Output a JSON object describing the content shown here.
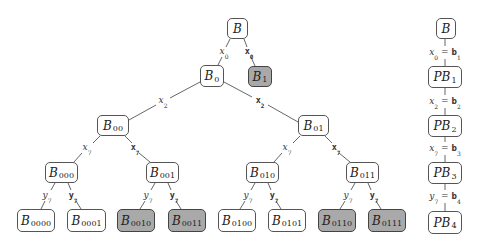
{
  "tree": {
    "nodes": [
      {
        "id": "B",
        "base": "B",
        "sub": "",
        "x": 227,
        "y": 18,
        "w": 21,
        "h": 21,
        "shaded": false
      },
      {
        "id": "B0",
        "base": "B",
        "sub": "0",
        "x": 200,
        "y": 65,
        "w": 24,
        "h": 22,
        "shaded": false
      },
      {
        "id": "B1",
        "base": "B",
        "sub": "1",
        "x": 248,
        "y": 66,
        "w": 24,
        "h": 21,
        "shaded": true
      },
      {
        "id": "B00",
        "base": "B",
        "sub": "00",
        "x": 97,
        "y": 115,
        "w": 32,
        "h": 21,
        "shaded": false
      },
      {
        "id": "B01",
        "base": "B",
        "sub": "01",
        "x": 298,
        "y": 115,
        "w": 31,
        "h": 21,
        "shaded": false
      },
      {
        "id": "B000",
        "base": "B",
        "sub": "000",
        "x": 45,
        "y": 162,
        "w": 33,
        "h": 21,
        "shaded": false
      },
      {
        "id": "B001",
        "base": "B",
        "sub": "001",
        "x": 146,
        "y": 162,
        "w": 33,
        "h": 21,
        "shaded": false
      },
      {
        "id": "B010",
        "base": "B",
        "sub": "010",
        "x": 246,
        "y": 162,
        "w": 33,
        "h": 21,
        "shaded": false
      },
      {
        "id": "B011",
        "base": "B",
        "sub": "011",
        "x": 346,
        "y": 162,
        "w": 33,
        "h": 21,
        "shaded": false
      },
      {
        "id": "B0000",
        "base": "B",
        "sub": "0000",
        "x": 17,
        "y": 209,
        "w": 38,
        "h": 23,
        "shaded": false
      },
      {
        "id": "B0001",
        "base": "B",
        "sub": "0001",
        "x": 67,
        "y": 209,
        "w": 39,
        "h": 23,
        "shaded": false
      },
      {
        "id": "B0010",
        "base": "B",
        "sub": "0010",
        "x": 117,
        "y": 209,
        "w": 38,
        "h": 23,
        "shaded": true
      },
      {
        "id": "B0011",
        "base": "B",
        "sub": "0011",
        "x": 168,
        "y": 209,
        "w": 38,
        "h": 23,
        "shaded": true
      },
      {
        "id": "B0100",
        "base": "B",
        "sub": "0100",
        "x": 218,
        "y": 209,
        "w": 38,
        "h": 23,
        "shaded": false
      },
      {
        "id": "B0101",
        "base": "B",
        "sub": "0101",
        "x": 268,
        "y": 209,
        "w": 38,
        "h": 23,
        "shaded": false
      },
      {
        "id": "B0110",
        "base": "B",
        "sub": "0110",
        "x": 318,
        "y": 209,
        "w": 38,
        "h": 23,
        "shaded": true
      },
      {
        "id": "B0111",
        "base": "B",
        "sub": "0111",
        "x": 368,
        "y": 209,
        "w": 38,
        "h": 23,
        "shaded": true
      }
    ],
    "edge_labels": [
      {
        "text": "x",
        "sub": "0",
        "style": "it",
        "x": 224,
        "y": 52
      },
      {
        "text": "x",
        "sub": "0",
        "style": "bd",
        "x": 249,
        "y": 52
      },
      {
        "text": "x",
        "sub": "2",
        "style": "it",
        "x": 163,
        "y": 101
      },
      {
        "text": "x",
        "sub": "2",
        "style": "bd",
        "x": 260,
        "y": 101
      },
      {
        "text": "x",
        "sub": "7",
        "style": "it",
        "x": 87,
        "y": 148
      },
      {
        "text": "x",
        "sub": "7",
        "style": "bd",
        "x": 135,
        "y": 148
      },
      {
        "text": "x",
        "sub": "7",
        "style": "it",
        "x": 287,
        "y": 148
      },
      {
        "text": "x",
        "sub": "7",
        "style": "bd",
        "x": 336,
        "y": 148
      },
      {
        "text": "y",
        "sub": "7",
        "style": "it",
        "x": 47,
        "y": 196
      },
      {
        "text": "y",
        "sub": "7",
        "style": "bd",
        "x": 73,
        "y": 196
      },
      {
        "text": "y",
        "sub": "7",
        "style": "it",
        "x": 148,
        "y": 196
      },
      {
        "text": "y",
        "sub": "7",
        "style": "bd",
        "x": 174,
        "y": 196
      },
      {
        "text": "y",
        "sub": "7",
        "style": "it",
        "x": 248,
        "y": 196
      },
      {
        "text": "y",
        "sub": "7",
        "style": "bd",
        "x": 274,
        "y": 196
      },
      {
        "text": "y",
        "sub": "7",
        "style": "it",
        "x": 348,
        "y": 196
      },
      {
        "text": "y",
        "sub": "7",
        "style": "bd",
        "x": 374,
        "y": 196
      }
    ],
    "edges": [
      [
        230,
        39,
        226,
        47
      ],
      [
        222,
        57,
        218,
        65
      ],
      [
        244,
        39,
        247,
        47
      ],
      [
        251,
        57,
        255,
        66
      ],
      [
        200,
        82,
        170,
        98
      ],
      [
        156,
        105,
        129,
        120
      ],
      [
        224,
        82,
        252,
        97
      ],
      [
        268,
        105,
        298,
        122
      ],
      [
        100,
        136,
        93,
        143
      ],
      [
        82,
        153,
        74,
        162
      ],
      [
        125,
        136,
        132,
        143
      ],
      [
        139,
        153,
        150,
        162
      ],
      [
        300,
        136,
        293,
        143
      ],
      [
        282,
        153,
        274,
        162
      ],
      [
        325,
        136,
        332,
        143
      ],
      [
        339,
        153,
        350,
        162
      ],
      [
        55,
        183,
        51,
        190
      ],
      [
        45,
        201,
        41,
        209
      ],
      [
        68,
        183,
        71,
        190
      ],
      [
        76,
        201,
        81,
        209
      ],
      [
        155,
        183,
        151,
        190
      ],
      [
        145,
        201,
        140,
        209
      ],
      [
        168,
        183,
        171,
        190
      ],
      [
        176,
        201,
        181,
        209
      ],
      [
        255,
        183,
        251,
        190
      ],
      [
        245,
        201,
        240,
        209
      ],
      [
        268,
        183,
        271,
        190
      ],
      [
        276,
        201,
        281,
        209
      ],
      [
        355,
        183,
        351,
        190
      ],
      [
        345,
        201,
        340,
        209
      ],
      [
        368,
        183,
        371,
        190
      ],
      [
        376,
        201,
        381,
        209
      ]
    ]
  },
  "path": {
    "nodes": [
      {
        "id": "PB_root",
        "base": "B",
        "sub": "",
        "x": 436,
        "y": 18,
        "w": 20,
        "h": 21
      },
      {
        "id": "PB1",
        "base": "PB",
        "sub": "1",
        "x": 428,
        "y": 66,
        "w": 34,
        "h": 22
      },
      {
        "id": "PB2",
        "base": "PB",
        "sub": "2",
        "x": 428,
        "y": 115,
        "w": 34,
        "h": 22
      },
      {
        "id": "PB3",
        "base": "PB",
        "sub": "3",
        "x": 428,
        "y": 162,
        "w": 34,
        "h": 22
      },
      {
        "id": "PB4",
        "base": "PB",
        "sub": "4",
        "x": 428,
        "y": 211,
        "w": 34,
        "h": 23
      }
    ],
    "labels": [
      {
        "lhs": "x",
        "lsub": "0",
        "rhs": "b",
        "rsub": "1",
        "x": 445,
        "y": 53
      },
      {
        "lhs": "x",
        "lsub": "2",
        "rhs": "b",
        "rsub": "2",
        "x": 445,
        "y": 102
      },
      {
        "lhs": "x",
        "lsub": "7",
        "rhs": "b",
        "rsub": "3",
        "x": 445,
        "y": 149
      },
      {
        "lhs": "y",
        "lsub": "7",
        "rhs": "b",
        "rsub": "4",
        "x": 445,
        "y": 197
      }
    ],
    "edges": [
      [
        445,
        39,
        445,
        46
      ],
      [
        445,
        59,
        445,
        66
      ],
      [
        445,
        88,
        445,
        95
      ],
      [
        445,
        108,
        445,
        115
      ],
      [
        445,
        137,
        445,
        142
      ],
      [
        445,
        155,
        445,
        162
      ],
      [
        445,
        184,
        445,
        190
      ],
      [
        445,
        203,
        445,
        211
      ]
    ],
    "equals": "="
  },
  "colors": {
    "shaded": "#a9a9a9",
    "stroke": "#555555"
  }
}
